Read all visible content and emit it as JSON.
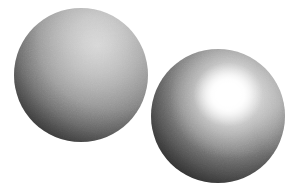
{
  "scene": {
    "title": "Two shaded spheres",
    "description": "Grayscale rendering comparison: a matte (Lambertian) sphere beside a glossy (specular) sphere on a plain white field.",
    "width": 295,
    "height": 192,
    "background_color": "#ffffff",
    "light_direction": "upper-right",
    "noise": "film-grain"
  },
  "objects": [
    {
      "id": "sphere-matte",
      "label": "Matte sphere",
      "shading_model": "diffuse",
      "has_specular_highlight": false,
      "center_x": 81,
      "center_y": 75,
      "radius": 67,
      "brightest_gray": "#d6d6d6",
      "darkest_gray": "#121212",
      "light_spot_x": 95,
      "light_spot_y": 45
    },
    {
      "id": "sphere-glossy",
      "label": "Glossy sphere",
      "shading_model": "specular",
      "has_specular_highlight": true,
      "center_x": 218,
      "center_y": 116,
      "radius": 67,
      "brightest_gray": "#ffffff",
      "darkest_gray": "#111111",
      "highlight_x": 228,
      "highlight_y": 95,
      "highlight_radius": 22
    }
  ]
}
